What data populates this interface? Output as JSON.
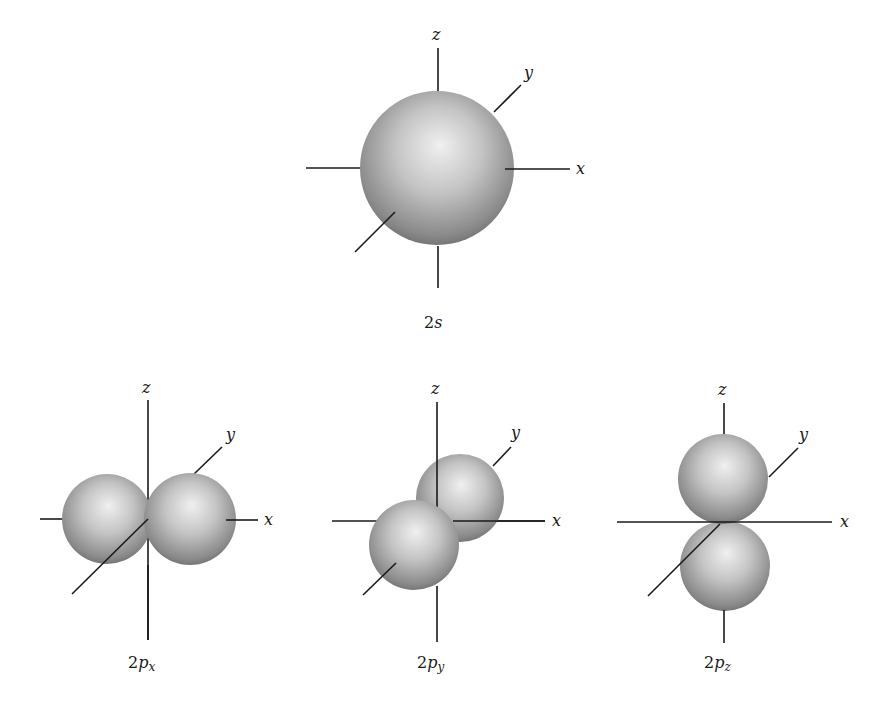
{
  "figure": {
    "orbitals": [
      {
        "id": "2s",
        "caption_main": "2",
        "caption_sub_letter": "s",
        "caption_subscript": "",
        "axes": {
          "x": "x",
          "y": "y",
          "z": "z"
        }
      },
      {
        "id": "2px",
        "caption_main": "2",
        "caption_sub_letter": "p",
        "caption_subscript": "x",
        "axes": {
          "x": "x",
          "y": "y",
          "z": "z"
        }
      },
      {
        "id": "2py",
        "caption_main": "2",
        "caption_sub_letter": "p",
        "caption_subscript": "y",
        "axes": {
          "x": "x",
          "y": "y",
          "z": "z"
        }
      },
      {
        "id": "2pz",
        "caption_main": "2",
        "caption_sub_letter": "p",
        "caption_subscript": "z",
        "axes": {
          "x": "x",
          "y": "y",
          "z": "z"
        }
      }
    ],
    "colors": {
      "sphere_highlight": "#f2f2f2",
      "sphere_mid": "#bdbdbd",
      "sphere_shadow": "#6e6e6e",
      "axis": "#1a1a1a",
      "background": "#ffffff"
    }
  }
}
